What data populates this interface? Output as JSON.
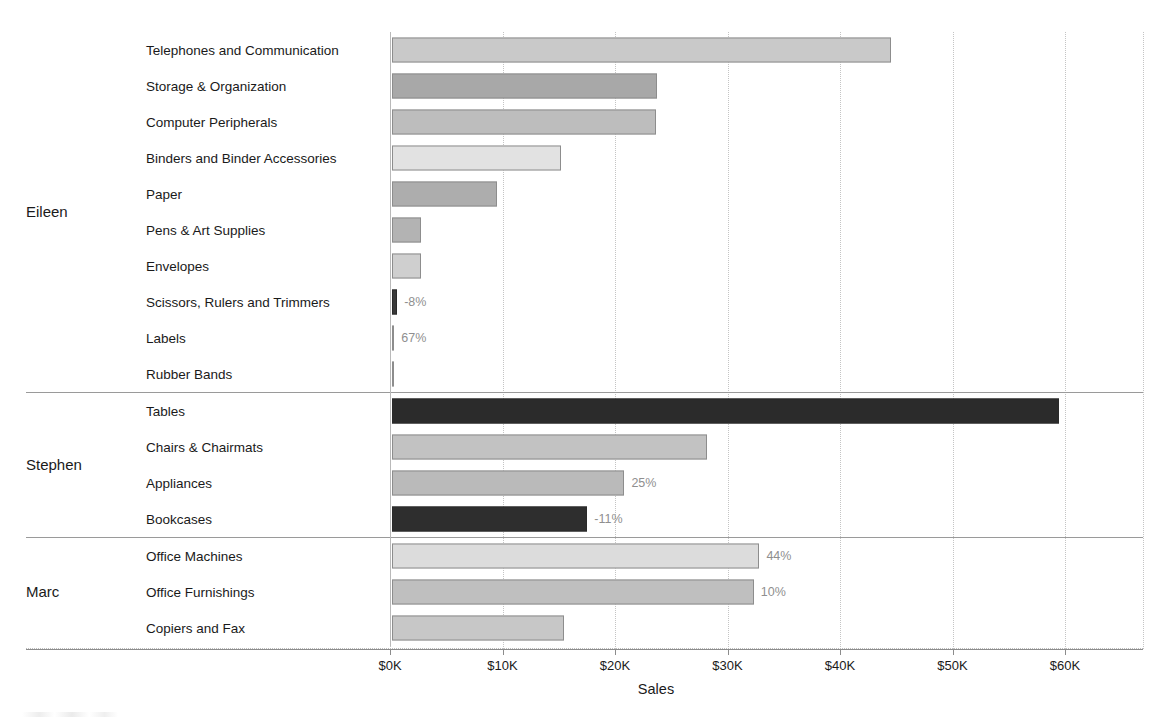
{
  "axis": {
    "title": "Sales",
    "ticks": [
      "$0K",
      "$10K",
      "$20K",
      "$30K",
      "$40K",
      "$50K",
      "$60K"
    ],
    "tick_values": [
      0,
      10000,
      20000,
      30000,
      40000,
      50000,
      60000
    ]
  },
  "panes": [
    {
      "person": "Eileen",
      "rows": [
        {
          "category": "Telephones and Communication",
          "value": 44400,
          "label": "",
          "shade": "#c9c9c9"
        },
        {
          "category": "Storage & Organization",
          "value": 23600,
          "label": "",
          "shade": "#a8a8a8"
        },
        {
          "category": "Computer Peripherals",
          "value": 23500,
          "label": "",
          "shade": "#bdbdbd"
        },
        {
          "category": "Binders and Binder Accessories",
          "value": 15100,
          "label": "",
          "shade": "#e2e2e2"
        },
        {
          "category": "Paper",
          "value": 9400,
          "label": "",
          "shade": "#adadad"
        },
        {
          "category": "Pens & Art Supplies",
          "value": 2600,
          "label": "",
          "shade": "#b3b3b3"
        },
        {
          "category": "Envelopes",
          "value": 2600,
          "label": "",
          "shade": "#cfcfcf"
        },
        {
          "category": "Scissors, Rulers and Trimmers",
          "value": 500,
          "label": "-8%",
          "shade": "#3a3a3a"
        },
        {
          "category": "Labels",
          "value": 250,
          "label": "67%",
          "shade": "#d8d8d8"
        },
        {
          "category": "Rubber Bands",
          "value": 80,
          "label": "",
          "shade": "#cccccc"
        }
      ]
    },
    {
      "person": "Stephen",
      "rows": [
        {
          "category": "Tables",
          "value": 59300,
          "label": "",
          "shade": "#2b2b2b"
        },
        {
          "category": "Chairs & Chairmats",
          "value": 28000,
          "label": "",
          "shade": "#c2c2c2"
        },
        {
          "category": "Appliances",
          "value": 20700,
          "label": "25%",
          "shade": "#bababa"
        },
        {
          "category": "Bookcases",
          "value": 17400,
          "label": "-11%",
          "shade": "#2e2e2e"
        }
      ]
    },
    {
      "person": "Marc",
      "rows": [
        {
          "category": "Office Machines",
          "value": 32700,
          "label": "44%",
          "shade": "#dcdcdc"
        },
        {
          "category": "Office Furnishings",
          "value": 32200,
          "label": "10%",
          "shade": "#bfbfbf"
        },
        {
          "category": "Copiers and Fax",
          "value": 15300,
          "label": "",
          "shade": "#c7c7c7"
        }
      ]
    }
  ],
  "chart_data": {
    "type": "bar",
    "title": "",
    "orientation": "horizontal",
    "xlabel": "Sales",
    "ylabel": "",
    "xlim": [
      0,
      66000
    ],
    "xticks": [
      0,
      10000,
      20000,
      30000,
      40000,
      50000,
      60000
    ],
    "xticklabels": [
      "$0K",
      "$10K",
      "$20K",
      "$30K",
      "$40K",
      "$50K",
      "$60K"
    ],
    "grid": "vertical-dotted",
    "legend": "none",
    "group_field": "Salesperson",
    "categories": [
      "Telephones and Communication",
      "Storage & Organization",
      "Computer Peripherals",
      "Binders and Binder Accessories",
      "Paper",
      "Pens & Art Supplies",
      "Envelopes",
      "Scissors, Rulers and Trimmers",
      "Labels",
      "Rubber Bands",
      "Tables",
      "Chairs & Chairmats",
      "Appliances",
      "Bookcases",
      "Office Machines",
      "Office Furnishings",
      "Copiers and Fax"
    ],
    "groups": [
      "Eileen",
      "Eileen",
      "Eileen",
      "Eileen",
      "Eileen",
      "Eileen",
      "Eileen",
      "Eileen",
      "Eileen",
      "Eileen",
      "Stephen",
      "Stephen",
      "Stephen",
      "Stephen",
      "Marc",
      "Marc",
      "Marc"
    ],
    "values": [
      44400,
      23600,
      23500,
      15100,
      9400,
      2600,
      2600,
      500,
      250,
      80,
      59300,
      28000,
      20700,
      17400,
      32700,
      32200,
      15300
    ],
    "annotations": [
      {
        "category": "Scissors, Rulers and Trimmers",
        "text": "-8%"
      },
      {
        "category": "Labels",
        "text": "67%"
      },
      {
        "category": "Appliances",
        "text": "25%"
      },
      {
        "category": "Bookcases",
        "text": "-11%"
      },
      {
        "category": "Office Machines",
        "text": "44%"
      },
      {
        "category": "Office Furnishings",
        "text": "10%"
      }
    ]
  }
}
